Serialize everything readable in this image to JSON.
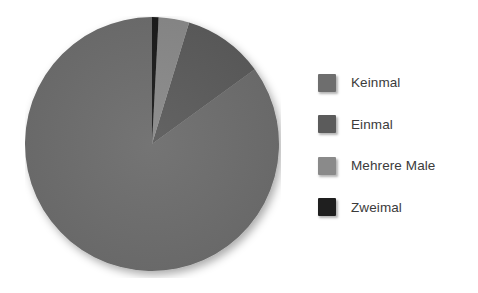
{
  "chart_data": {
    "type": "pie",
    "title": "",
    "subtitle": "",
    "xlabel": "",
    "ylabel": "",
    "grid": false,
    "start_angle_deg": 90,
    "direction": "counterclockwise",
    "legend_position": "right",
    "categories": [
      "Keinmal",
      "Einmal",
      "Mehrere Male",
      "Zweimal"
    ],
    "values": [
      85.0,
      10.3,
      3.9,
      0.8
    ],
    "value_unit": "percent",
    "angles_deg": [
      306.0,
      37.0,
      14.0,
      3.0
    ],
    "slices": [
      {
        "label": "Keinmal",
        "value": 85.0,
        "angle_deg": 306.0,
        "color": "#6e6e6e"
      },
      {
        "label": "Einmal",
        "value": 10.3,
        "angle_deg": 37.0,
        "color": "#5b5b5b"
      },
      {
        "label": "Mehrere Male",
        "value": 3.9,
        "angle_deg": 14.0,
        "color": "#8a8a8a"
      },
      {
        "label": "Zweimal",
        "value": 0.8,
        "angle_deg": 3.0,
        "color": "#1f1f1f"
      }
    ]
  },
  "legend": {
    "items": [
      {
        "label": "Keinmal",
        "color": "#6e6e6e"
      },
      {
        "label": "Einmal",
        "color": "#5b5b5b"
      },
      {
        "label": "Mehrere Male",
        "color": "#8a8a8a"
      },
      {
        "label": "Zweimal",
        "color": "#1f1f1f"
      }
    ]
  },
  "colors": {
    "background": "#ffffff",
    "text": "#3b3b3b",
    "keinmal": "#6e6e6e",
    "einmal": "#5b5b5b",
    "mehrere_male": "#8a8a8a",
    "zweimal": "#1f1f1f"
  }
}
